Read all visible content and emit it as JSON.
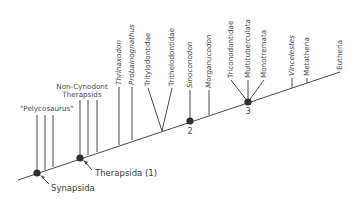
{
  "diagram": {
    "type": "cladogram",
    "root_group_label": "\"Pelycosaurus\"",
    "non_cynodont_label_line1": "Non-Cynodont",
    "non_cynodont_label_line2": "Therapsids",
    "taxa": [
      {
        "name": "Thrinaxodon",
        "italic": true
      },
      {
        "name": "Probainognathus",
        "italic": true
      },
      {
        "name": "Tritylodontidae",
        "italic": false
      },
      {
        "name": "Trithelodontidae",
        "italic": false
      },
      {
        "name": "Sinoconodon",
        "italic": true
      },
      {
        "name": "Morganucodon",
        "italic": true
      },
      {
        "name": "Triconodontidae",
        "italic": false
      },
      {
        "name": "Multituberculata",
        "italic": false
      },
      {
        "name": "Monotremata",
        "italic": false
      },
      {
        "name": "Vincelestes",
        "italic": true
      },
      {
        "name": "Metatheria",
        "italic": false
      },
      {
        "name": "Eutheria",
        "italic": false
      }
    ],
    "nodes": {
      "synapsida": "Synapsida",
      "therapsida": "Therapsida (1)",
      "node2": "2",
      "node3": "3"
    },
    "colors": {
      "line": "#4a4a4a",
      "node": "#2f2f2f",
      "background": "#ffffff"
    }
  }
}
